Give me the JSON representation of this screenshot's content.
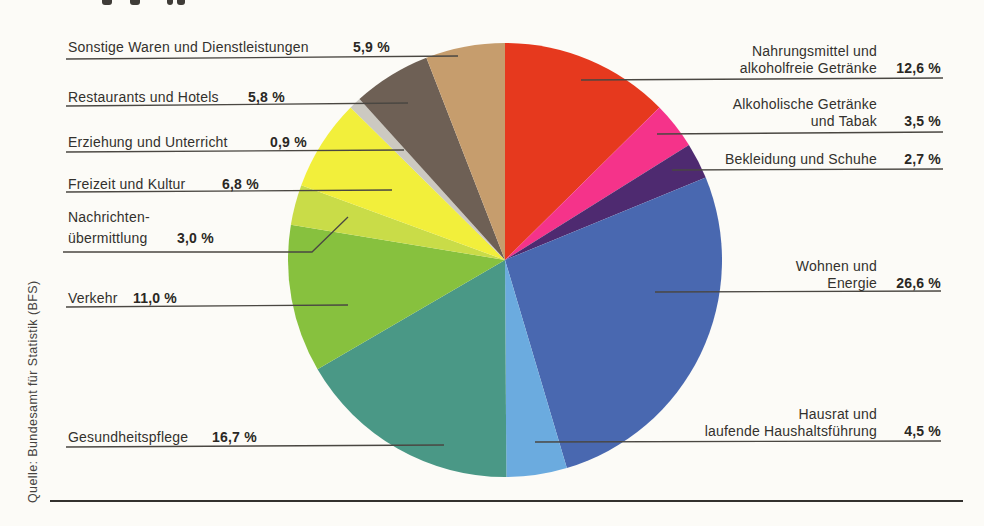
{
  "source_note": "Quelle: Bundesamt für Statistik (BFS)",
  "chart_data": {
    "type": "pie",
    "title": "",
    "unit": "%",
    "start_angle_deg": 0,
    "direction": "clockwise",
    "total": 100.0,
    "slices": [
      {
        "id": "nahrungsmittel",
        "label_lines": [
          "Nahrungsmittel und",
          "alkoholfreie Getränke"
        ],
        "value": 12.6,
        "value_display": "12,6 %",
        "color": "#e6391e",
        "label_side": "right"
      },
      {
        "id": "alkoholische",
        "label_lines": [
          "Alkoholische Getränke",
          "und Tabak"
        ],
        "value": 3.5,
        "value_display": "3,5 %",
        "color": "#f5338a",
        "label_side": "right"
      },
      {
        "id": "bekleidung",
        "label_lines": [
          "Bekleidung und Schuhe"
        ],
        "value": 2.7,
        "value_display": "2,7 %",
        "color": "#4e2a70",
        "label_side": "right"
      },
      {
        "id": "wohnen",
        "label_lines": [
          "Wohnen und",
          "Energie"
        ],
        "value": 26.6,
        "value_display": "26,6 %",
        "color": "#4968b0",
        "label_side": "right"
      },
      {
        "id": "hausrat",
        "label_lines": [
          "Hausrat und",
          "laufende Haushaltsführung"
        ],
        "value": 4.5,
        "value_display": "4,5 %",
        "color": "#6babdf",
        "label_side": "right"
      },
      {
        "id": "gesundheitspflege",
        "label_lines": [
          "Gesundheitspflege"
        ],
        "value": 16.7,
        "value_display": "16,7 %",
        "color": "#4a9886",
        "label_side": "left"
      },
      {
        "id": "verkehr",
        "label_lines": [
          "Verkehr"
        ],
        "value": 11.0,
        "value_display": "11,0 %",
        "color": "#87c13e",
        "label_side": "left"
      },
      {
        "id": "nachrichtenuebermittlung",
        "label_lines": [
          "Nachrichten-",
          "übermittlung"
        ],
        "value": 3.0,
        "value_display": "3,0 %",
        "color": "#c9dc48",
        "label_side": "left"
      },
      {
        "id": "freizeit",
        "label_lines": [
          "Freizeit und Kultur"
        ],
        "value": 6.8,
        "value_display": "6,8 %",
        "color": "#f2ef3b",
        "label_side": "left"
      },
      {
        "id": "erziehung",
        "label_lines": [
          "Erziehung und Unterricht"
        ],
        "value": 0.9,
        "value_display": "0,9 %",
        "color": "#ccc9c1",
        "label_side": "left"
      },
      {
        "id": "restaurants",
        "label_lines": [
          "Restaurants und Hotels"
        ],
        "value": 5.8,
        "value_display": "5,8 %",
        "color": "#6e6055",
        "label_side": "left"
      },
      {
        "id": "sonstige",
        "label_lines": [
          "Sonstige Waren und Dienstleistungen"
        ],
        "value": 5.9,
        "value_display": "5,9 %",
        "color": "#c69d6d",
        "label_side": "left"
      }
    ]
  }
}
